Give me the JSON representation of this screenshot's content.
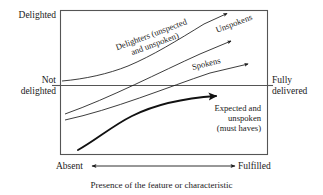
{
  "diagram": {
    "caption": "Presence of the feature or characteristic",
    "colors": {
      "background": "#ffffff",
      "line": "#1a1a1a",
      "box_border": "#555555",
      "emphasis_curve": "#111111"
    },
    "axes": {
      "y_top_label": "Delighted",
      "y_bottom_label": "Not\ndelighted",
      "y_right_label": "Fully\ndelivered",
      "x_left_label": "Absent",
      "x_right_label": "Fulfilled"
    },
    "curves": [
      {
        "id": "delighters",
        "label": "Delighters (unspected\nand unspoken)",
        "arrow": "up-right",
        "weight": "thin"
      },
      {
        "id": "unspokens",
        "label": "Unspokens",
        "arrow": "up-right",
        "weight": "thin"
      },
      {
        "id": "spokens",
        "label": "Spokens",
        "arrow": "right",
        "weight": "thin"
      },
      {
        "id": "expected",
        "label": "Expected and\nunspoken\n(must haves)",
        "arrow": "right",
        "weight": "thick"
      }
    ]
  }
}
